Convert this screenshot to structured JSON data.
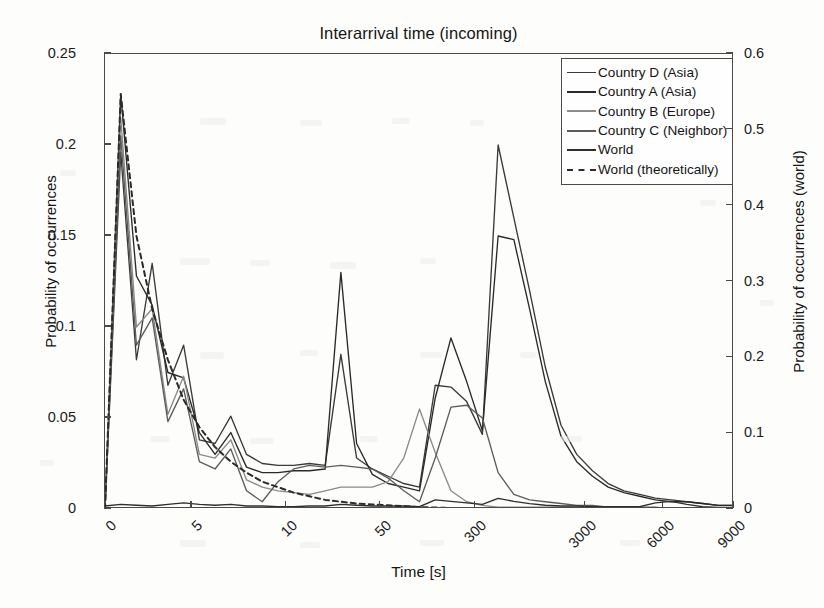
{
  "chart_data": {
    "type": "line",
    "title": "Interarrival time (incoming)",
    "xlabel": "Time [s]",
    "ylabel": "Probability of occurrences",
    "ylabel_right": "Probability of occurrences (world)",
    "grid": false,
    "legend_position": "top-right",
    "x_tick_labels": [
      "0",
      "5",
      "10",
      "50",
      "300",
      "3000",
      "6000",
      "9000"
    ],
    "x_tick_positions": [
      0,
      5.5,
      11.5,
      17.5,
      23.5,
      30.5,
      35.5,
      40.0
    ],
    "x_index_range": [
      0,
      40
    ],
    "ylim": [
      0,
      0.25
    ],
    "y_ticks": [
      "0",
      "0.05",
      "0.1",
      "0.15",
      "0.2",
      "0.25"
    ],
    "y_tick_values": [
      0,
      0.05,
      0.1,
      0.15,
      0.2,
      0.25
    ],
    "ylim_right": [
      0,
      0.6
    ],
    "y_ticks_right": [
      "0",
      "0.1",
      "0.2",
      "0.3",
      "0.4",
      "0.5",
      "0.6"
    ],
    "y_tick_values_right": [
      0,
      0.1,
      0.2,
      0.3,
      0.4,
      0.5,
      0.6
    ],
    "note_axis_mapping": "World series plotted against right-hand axis (0 to 0.6)",
    "series": [
      {
        "name": "Country D (Asia)",
        "color": "#3a3a3a",
        "style": "solid",
        "axis": "left",
        "x": [
          0,
          1,
          2,
          3,
          4,
          5,
          6,
          7,
          8,
          9,
          10,
          11,
          12,
          13,
          14,
          15,
          16,
          17,
          18,
          19,
          20,
          21,
          22,
          23,
          24,
          25,
          26,
          27,
          28,
          29,
          30,
          31,
          32,
          33,
          34,
          35,
          36,
          37,
          38,
          39,
          40
        ],
        "values": [
          0.0,
          0.196,
          0.082,
          0.135,
          0.068,
          0.09,
          0.038,
          0.036,
          0.051,
          0.03,
          0.025,
          0.024,
          0.024,
          0.025,
          0.024,
          0.085,
          0.028,
          0.022,
          0.018,
          0.014,
          0.012,
          0.068,
          0.067,
          0.059,
          0.041,
          0.2,
          0.16,
          0.12,
          0.078,
          0.046,
          0.03,
          0.021,
          0.014,
          0.01,
          0.008,
          0.006,
          0.005,
          0.004,
          0.003,
          0.002,
          0.002
        ]
      },
      {
        "name": "Country A (Asia)",
        "color": "#2a2a2a",
        "style": "solid",
        "axis": "left",
        "x": [
          0,
          1,
          2,
          3,
          4,
          5,
          6,
          7,
          8,
          9,
          10,
          11,
          12,
          13,
          14,
          15,
          16,
          17,
          18,
          19,
          20,
          21,
          22,
          23,
          24,
          25,
          26,
          27,
          28,
          29,
          30,
          31,
          32,
          33,
          34,
          35,
          36,
          37,
          38,
          39,
          40
        ],
        "values": [
          0.0,
          0.228,
          0.128,
          0.112,
          0.075,
          0.072,
          0.042,
          0.03,
          0.042,
          0.023,
          0.02,
          0.02,
          0.021,
          0.021,
          0.022,
          0.13,
          0.036,
          0.019,
          0.014,
          0.012,
          0.01,
          0.061,
          0.094,
          0.07,
          0.043,
          0.15,
          0.148,
          0.11,
          0.07,
          0.04,
          0.026,
          0.018,
          0.012,
          0.009,
          0.007,
          0.005,
          0.004,
          0.004,
          0.003,
          0.002,
          0.002
        ]
      },
      {
        "name": "Country B (Europe)",
        "color": "#8a8a8a",
        "style": "solid",
        "axis": "left",
        "x": [
          0,
          1,
          2,
          3,
          4,
          5,
          6,
          7,
          8,
          9,
          10,
          11,
          12,
          13,
          14,
          15,
          16,
          17,
          18,
          19,
          20,
          21,
          22,
          23,
          24,
          25,
          26,
          27,
          28,
          29,
          30,
          31,
          32,
          33,
          34,
          35,
          36,
          37,
          38,
          39,
          40
        ],
        "values": [
          0.0,
          0.215,
          0.1,
          0.11,
          0.052,
          0.073,
          0.03,
          0.028,
          0.038,
          0.016,
          0.012,
          0.01,
          0.009,
          0.008,
          0.01,
          0.012,
          0.012,
          0.012,
          0.015,
          0.028,
          0.055,
          0.031,
          0.01,
          0.004,
          0.002,
          0.001,
          0.001,
          0.001,
          0.001,
          0.001,
          0.001,
          0.001,
          0.0,
          0.0,
          0.0,
          0.0,
          0.0,
          0.0,
          0.0,
          0.0,
          0.0
        ]
      },
      {
        "name": "Country C (Neighbor)",
        "color": "#5c5c5c",
        "style": "solid",
        "axis": "left",
        "x": [
          0,
          1,
          2,
          3,
          4,
          5,
          6,
          7,
          8,
          9,
          10,
          11,
          12,
          13,
          14,
          15,
          16,
          17,
          18,
          19,
          20,
          21,
          22,
          23,
          24,
          25,
          26,
          27,
          28,
          29,
          30,
          31,
          32,
          33,
          34,
          35,
          36,
          37,
          38,
          39,
          40
        ],
        "values": [
          0.0,
          0.205,
          0.09,
          0.105,
          0.048,
          0.066,
          0.026,
          0.022,
          0.033,
          0.01,
          0.004,
          0.015,
          0.022,
          0.024,
          0.023,
          0.024,
          0.023,
          0.022,
          0.017,
          0.01,
          0.004,
          0.028,
          0.056,
          0.057,
          0.05,
          0.02,
          0.008,
          0.005,
          0.004,
          0.003,
          0.002,
          0.002,
          0.001,
          0.001,
          0.001,
          0.001,
          0.0,
          0.0,
          0.0,
          0.0,
          0.0
        ]
      },
      {
        "name": "World",
        "color": "#2e2e2e",
        "style": "solid",
        "axis": "right",
        "x": [
          0,
          1,
          2,
          3,
          4,
          5,
          6,
          7,
          8,
          9,
          10,
          11,
          12,
          13,
          14,
          15,
          16,
          17,
          18,
          19,
          20,
          21,
          22,
          23,
          24,
          25,
          26,
          27,
          28,
          29,
          30,
          31,
          32,
          33,
          34,
          35,
          36,
          37,
          38,
          39,
          40
        ],
        "values": [
          0.004,
          0.006,
          0.005,
          0.004,
          0.006,
          0.008,
          0.006,
          0.005,
          0.006,
          0.004,
          0.004,
          0.003,
          0.003,
          0.004,
          0.004,
          0.006,
          0.005,
          0.004,
          0.004,
          0.004,
          0.003,
          0.012,
          0.01,
          0.008,
          0.006,
          0.014,
          0.01,
          0.007,
          0.005,
          0.004,
          0.004,
          0.003,
          0.003,
          0.003,
          0.003,
          0.008,
          0.01,
          0.006,
          0.003,
          0.002,
          0.002
        ]
      },
      {
        "name": "World (theoretically)",
        "color": "#2b2b2b",
        "style": "dashed",
        "axis": "left",
        "x": [
          0,
          1,
          2,
          3,
          4,
          5,
          6,
          7,
          8,
          9,
          10,
          11,
          12,
          13,
          14,
          15,
          16,
          17,
          18,
          19,
          20,
          21,
          22,
          23,
          24,
          25,
          26,
          27,
          28,
          29,
          30,
          31,
          32,
          33,
          34,
          35,
          36,
          37,
          38,
          39,
          40
        ],
        "values": [
          0.0,
          0.228,
          0.15,
          0.11,
          0.082,
          0.06,
          0.045,
          0.034,
          0.026,
          0.02,
          0.015,
          0.012,
          0.009,
          0.007,
          0.005,
          0.004,
          0.003,
          0.0025,
          0.002,
          0.0015,
          0.001,
          0.0008,
          0.0006,
          0.0005,
          0.0004,
          0.0003,
          0.0002,
          0.0002,
          0.0001,
          0.0001,
          0.0001,
          0.0,
          0.0,
          0.0,
          0.0,
          0.0,
          0.0,
          0.0,
          0.0,
          0.0,
          0.0
        ]
      }
    ]
  },
  "legend": {
    "entries": [
      {
        "label": "Country D (Asia)",
        "color": "#3a3a3a",
        "style": "solid"
      },
      {
        "label": "Country A (Asia)",
        "color": "#2a2a2a",
        "style": "solid"
      },
      {
        "label": "Country B (Europe)",
        "color": "#8a8a8a",
        "style": "solid"
      },
      {
        "label": "Country C (Neighbor)",
        "color": "#5c5c5c",
        "style": "solid"
      },
      {
        "label": "World",
        "color": "#2e2e2e",
        "style": "solid"
      },
      {
        "label": "World (theoretically)",
        "color": "#2b2b2b",
        "style": "dashed"
      }
    ]
  },
  "colors": {
    "axis": "#4a4a4a",
    "text": "#151515",
    "background": "#fdfdfc"
  }
}
